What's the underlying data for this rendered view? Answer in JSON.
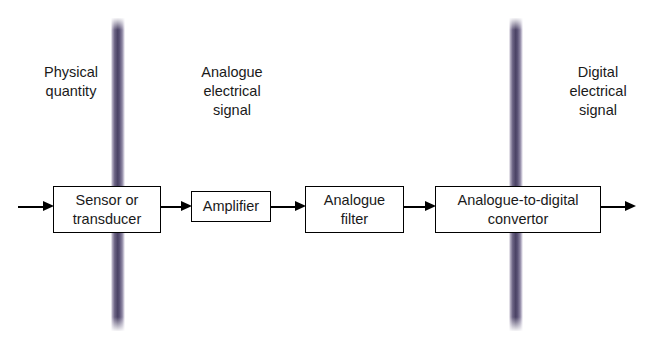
{
  "diagram": {
    "type": "block-flow",
    "colors": {
      "bar": "#4a4264",
      "box_border": "#000000",
      "text": "#1a1a1a",
      "background": "#ffffff"
    },
    "captions": [
      {
        "id": "physical-quantity",
        "text": "Physical\nquantity"
      },
      {
        "id": "analogue-electrical",
        "text": "Analogue\nelectrical\nsignal"
      },
      {
        "id": "digital-electrical",
        "text": "Digital\nelectrical\nsignal"
      }
    ],
    "blocks": [
      {
        "id": "sensor-or-transducer",
        "label": "Sensor or\ntransducer"
      },
      {
        "id": "amplifier",
        "label": "Amplifier"
      },
      {
        "id": "analogue-filter",
        "label": "Analogue\nfilter"
      },
      {
        "id": "analogue-to-digital-convertor",
        "label": "Analogue-to-digital\nconvertor"
      }
    ],
    "dividers": [
      {
        "id": "divider-physical-analogue",
        "position": "after-sensor"
      },
      {
        "id": "divider-analogue-digital",
        "position": "inside-adc"
      }
    ],
    "arrows": [
      {
        "id": "arrow-input"
      },
      {
        "id": "arrow-sensor-to-amplifier"
      },
      {
        "id": "arrow-amplifier-to-filter"
      },
      {
        "id": "arrow-filter-to-adc"
      },
      {
        "id": "arrow-output"
      }
    ]
  }
}
